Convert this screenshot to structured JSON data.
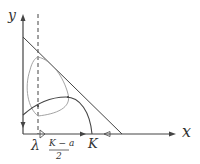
{
  "diagram": {
    "axes": {
      "x_label": "x",
      "y_label": "y"
    },
    "tick_labels": {
      "lambda": "λ",
      "frac_num": "K − a",
      "frac_den": "2",
      "k": "K"
    },
    "colors": {
      "line": "#444444",
      "loop": "#999999",
      "background": "#ffffff"
    }
  }
}
